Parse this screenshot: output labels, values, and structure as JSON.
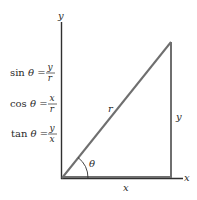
{
  "diagram": {
    "axes": {
      "x_label": "x",
      "y_label": "y"
    },
    "triangle": {
      "hypotenuse_label": "r",
      "opposite_label": "y",
      "adjacent_label": "x",
      "angle_label": "θ"
    },
    "formulas": [
      {
        "fn": "sin",
        "var": "θ",
        "num": "y",
        "den": "r"
      },
      {
        "fn": "cos",
        "var": "θ",
        "num": "x",
        "den": "r"
      },
      {
        "fn": "tan",
        "var": "θ",
        "num": "y",
        "den": "x"
      }
    ],
    "colors": {
      "axis": "#2f2f2f",
      "triangle": "#6f6f6f",
      "text": "#2a2a2a"
    }
  }
}
